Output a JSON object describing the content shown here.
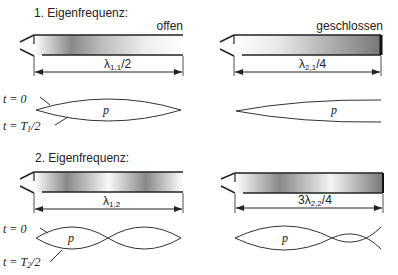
{
  "sections": [
    {
      "title": "1. Eigenfrequenz:",
      "pipes": [
        {
          "end_label": "offen",
          "dimension": {
            "symbol": "λ",
            "subscript": "1,1",
            "suffix": "/2",
            "prefix": ""
          },
          "wave_label": "p"
        },
        {
          "end_label": "geschlossen",
          "dimension": {
            "symbol": "λ",
            "subscript": "2,1",
            "suffix": "/4",
            "prefix": ""
          },
          "wave_label": "p"
        }
      ],
      "time_labels": {
        "t0": "t = 0",
        "t1_prefix": "t = T",
        "t1_sub": "1",
        "t1_suffix": "/2"
      }
    },
    {
      "title": "2. Eigenfrequenz:",
      "pipes": [
        {
          "end_label": "",
          "dimension": {
            "symbol": "λ",
            "subscript": "1,2",
            "suffix": "",
            "prefix": ""
          },
          "wave_label": "p"
        },
        {
          "end_label": "",
          "dimension": {
            "symbol": "λ",
            "subscript": "2,2",
            "suffix": "/4",
            "prefix": "3"
          },
          "wave_label": "p"
        }
      ],
      "time_labels": {
        "t0": "t = 0",
        "t1_prefix": "t = T",
        "t1_sub": "2",
        "t1_suffix": "/2"
      }
    }
  ]
}
